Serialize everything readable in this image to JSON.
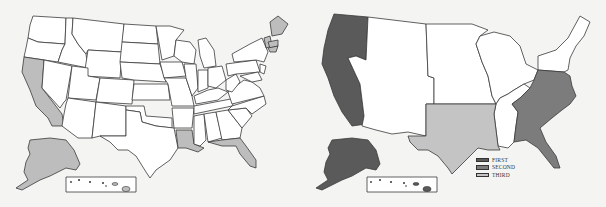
{
  "colors": {
    "background": "#f4f4f2",
    "unfilled": "#ffffff",
    "border": "#3a3a3a",
    "light": "#bdbdbd",
    "first": "#5a5a5a",
    "second": "#7c7c7c",
    "third": "#c4c4c4"
  },
  "maps": [
    {
      "id": "left",
      "description": "US state map with selected states highlighted",
      "highlighted_states": [
        "California",
        "Alaska",
        "Louisiana",
        "Florida",
        "Maine",
        "Massachusetts",
        "New Hampshire/Vermont region"
      ]
    },
    {
      "id": "right",
      "description": "US regional map with regions shaded by rank",
      "regions": [
        {
          "name": "Pacific (WA, OR, CA, AK)",
          "rank": "FIRST"
        },
        {
          "name": "Southeast Atlantic (VA to FL, incl. MD/DE)",
          "rank": "SECOND"
        },
        {
          "name": "South Central (TX, OK, AR, LA)",
          "rank": "THIRD"
        }
      ]
    }
  ],
  "legend": {
    "items": [
      {
        "label": "FIRST",
        "color": "#5a5a5a"
      },
      {
        "label": "SECOND",
        "color": "#7c7c7c"
      },
      {
        "label": "THIRD",
        "color": "#c4c4c4"
      }
    ]
  }
}
